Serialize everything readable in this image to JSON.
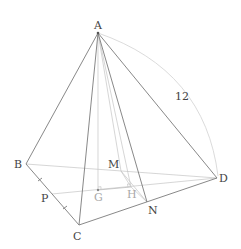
{
  "diagram": {
    "colors": {
      "background": "#ffffff",
      "edge": "#7a7a7a",
      "hidden_edge": "#c4c4c4",
      "arc": "#d2d2d2",
      "label": "#444444"
    },
    "points": {
      "A": {
        "label": "A",
        "x": 98,
        "y": 33
      },
      "B": {
        "label": "B",
        "x": 26,
        "y": 164
      },
      "C": {
        "label": "C",
        "x": 79,
        "y": 225
      },
      "D": {
        "label": "D",
        "x": 217,
        "y": 178
      },
      "N": {
        "label": "N",
        "x": 147,
        "y": 202
      },
      "M": {
        "label": "M",
        "x": 121,
        "y": 171
      },
      "G": {
        "label": "G",
        "x": 98,
        "y": 190
      },
      "H": {
        "label": "H",
        "x": 131,
        "y": 187
      },
      "P": {
        "label": "P",
        "x": 52,
        "y": 194
      }
    },
    "measurement": {
      "label": "12",
      "segment": "AD"
    }
  }
}
